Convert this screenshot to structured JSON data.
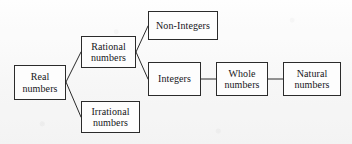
{
  "diagram": {
    "type": "tree-diagram",
    "background_color": "#fbfbfb",
    "box_border_color": "#2b2b2b",
    "box_fill_color": "#fdfdfd",
    "edge_color": "#2b2b2b",
    "text_color": "#16161a",
    "nodes": [
      {
        "id": "real",
        "label": "Real numbers",
        "line1": "Real",
        "line2": "numbers",
        "x": 14,
        "y": 65,
        "width": 52,
        "height": 35
      },
      {
        "id": "rational",
        "label": "Rational numbers",
        "line1": "Rational",
        "line2": "numbers",
        "x": 81,
        "y": 36,
        "width": 55,
        "height": 32
      },
      {
        "id": "irrational",
        "label": "Irrational numbers",
        "line1": "Irrational",
        "line2": "numbers",
        "x": 81,
        "y": 101,
        "width": 59,
        "height": 32
      },
      {
        "id": "non-integers",
        "label": "Non-Integers",
        "line1": "Non-Integers",
        "line2": "",
        "x": 148,
        "y": 11,
        "width": 70,
        "height": 29
      },
      {
        "id": "integers",
        "label": "Integers",
        "line1": "Integers",
        "line2": "",
        "x": 148,
        "y": 62,
        "width": 53,
        "height": 34
      },
      {
        "id": "whole",
        "label": "Whole numbers",
        "line1": "Whole",
        "line2": "numbers",
        "x": 216,
        "y": 62,
        "width": 52,
        "height": 34
      },
      {
        "id": "natural",
        "label": "Natural numbers",
        "line1": "Natural",
        "line2": "numbers",
        "x": 283,
        "y": 62,
        "width": 58,
        "height": 34
      }
    ],
    "edges": [
      {
        "id": "real-rational",
        "from": "real",
        "to": "rational",
        "x1": 66,
        "y1": 82,
        "x2": 81,
        "y2": 52
      },
      {
        "id": "real-irrational",
        "from": "real",
        "to": "irrational",
        "x1": 66,
        "y1": 82,
        "x2": 81,
        "y2": 117
      },
      {
        "id": "rational-nonintegers",
        "from": "rational",
        "to": "non-integers",
        "x1": 136,
        "y1": 52,
        "x2": 148,
        "y2": 26
      },
      {
        "id": "rational-integers",
        "from": "rational",
        "to": "integers",
        "x1": 136,
        "y1": 52,
        "x2": 148,
        "y2": 79
      },
      {
        "id": "integers-whole",
        "from": "integers",
        "to": "whole",
        "x1": 201,
        "y1": 79,
        "x2": 216,
        "y2": 79
      },
      {
        "id": "whole-natural",
        "from": "whole",
        "to": "natural",
        "x1": 268,
        "y1": 79,
        "x2": 283,
        "y2": 79
      }
    ]
  }
}
